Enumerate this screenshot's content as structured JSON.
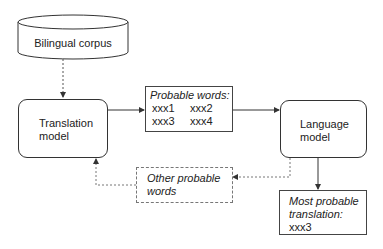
{
  "diagram": {
    "corpus": {
      "label": "Bilingual corpus"
    },
    "translation_model": {
      "line1": "Translation",
      "line2": "model"
    },
    "probable_words": {
      "title": "Probable words:",
      "words": [
        "xxx1",
        "xxx2",
        "xxx3",
        "xxx4"
      ]
    },
    "language_model": {
      "line1": "Language",
      "line2": "model"
    },
    "other_words": {
      "line1": "Other probable",
      "line2": "words"
    },
    "most_probable": {
      "line1": "Most probable",
      "line2": "translation:",
      "value": "xxx3"
    },
    "colors": {
      "stroke": "#333333",
      "dashed": "#777777",
      "background": "#ffffff"
    }
  }
}
